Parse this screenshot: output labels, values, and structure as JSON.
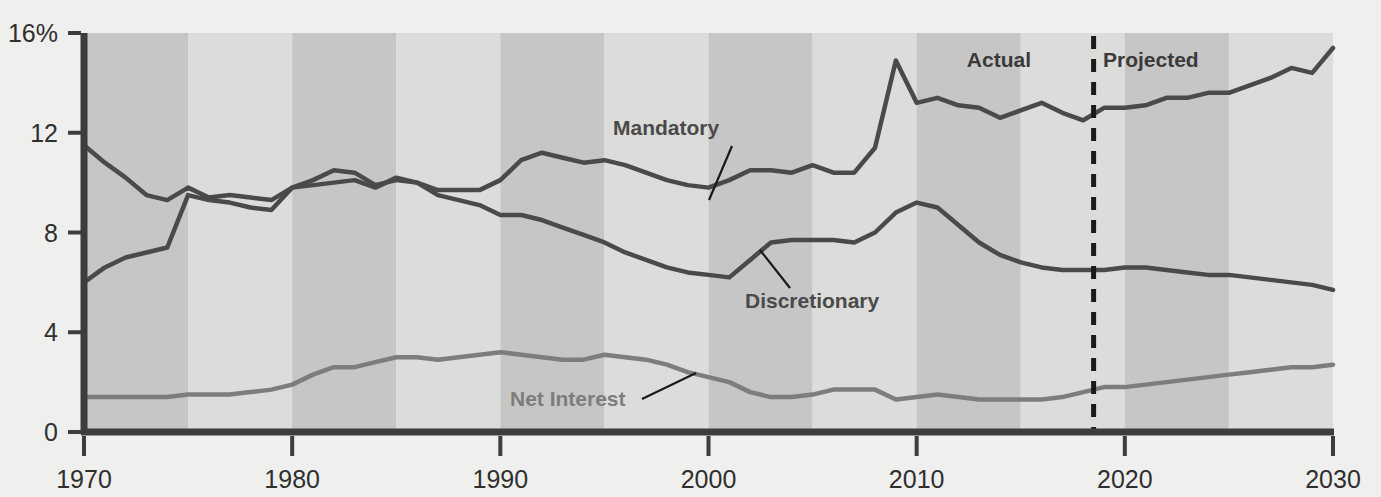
{
  "chart_data": {
    "type": "line",
    "title": "",
    "subtitle": "",
    "xlabel": "",
    "ylabel": "",
    "xlim": [
      1970,
      2030
    ],
    "ylim": [
      0,
      16
    ],
    "grid": false,
    "legend_position": "inline-annotations",
    "y_ticks": [
      0,
      4,
      8,
      12,
      16
    ],
    "y_tick_labels": [
      "0",
      "4",
      "8",
      "12",
      "16%"
    ],
    "x_ticks": [
      1970,
      1980,
      1990,
      2000,
      2010,
      2020,
      2030
    ],
    "x_tick_labels": [
      "1970",
      "1980",
      "1990",
      "2000",
      "2010",
      "2020",
      "2030"
    ],
    "x": [
      1970,
      1971,
      1972,
      1973,
      1974,
      1975,
      1976,
      1977,
      1978,
      1979,
      1980,
      1981,
      1982,
      1983,
      1984,
      1985,
      1986,
      1987,
      1988,
      1989,
      1990,
      1991,
      1992,
      1993,
      1994,
      1995,
      1996,
      1997,
      1998,
      1999,
      2000,
      2001,
      2002,
      2003,
      2004,
      2005,
      2006,
      2007,
      2008,
      2009,
      2010,
      2011,
      2012,
      2013,
      2014,
      2015,
      2016,
      2017,
      2018,
      2019,
      2020,
      2021,
      2022,
      2023,
      2024,
      2025,
      2026,
      2027,
      2028,
      2029,
      2030
    ],
    "series": [
      {
        "name": "Mandatory",
        "color": "#4a4a4a",
        "values": [
          6.0,
          6.6,
          7.0,
          7.2,
          7.4,
          9.5,
          9.3,
          9.2,
          9.0,
          8.9,
          9.8,
          10.1,
          10.5,
          10.4,
          9.9,
          10.1,
          10.0,
          9.7,
          9.7,
          9.7,
          10.1,
          10.9,
          11.2,
          11.0,
          10.8,
          10.9,
          10.7,
          10.4,
          10.1,
          9.9,
          9.8,
          10.1,
          10.5,
          10.5,
          10.4,
          10.7,
          10.4,
          10.4,
          11.4,
          14.9,
          13.2,
          13.4,
          13.1,
          13.0,
          12.6,
          12.9,
          13.2,
          12.8,
          12.5,
          13.0,
          13.0,
          13.1,
          13.4,
          13.4,
          13.6,
          13.6,
          13.9,
          14.2,
          14.6,
          14.4,
          15.4
        ]
      },
      {
        "name": "Discretionary",
        "color": "#4a4a4a",
        "values": [
          11.5,
          10.8,
          10.2,
          9.5,
          9.3,
          9.8,
          9.4,
          9.5,
          9.4,
          9.3,
          9.8,
          9.9,
          10.0,
          10.1,
          9.8,
          10.2,
          10.0,
          9.5,
          9.3,
          9.1,
          8.7,
          8.7,
          8.5,
          8.2,
          7.9,
          7.6,
          7.2,
          6.9,
          6.6,
          6.4,
          6.3,
          6.2,
          6.9,
          7.6,
          7.7,
          7.7,
          7.7,
          7.6,
          8.0,
          8.8,
          9.2,
          9.0,
          8.3,
          7.6,
          7.1,
          6.8,
          6.6,
          6.5,
          6.5,
          6.5,
          6.6,
          6.6,
          6.5,
          6.4,
          6.3,
          6.3,
          6.2,
          6.1,
          6.0,
          5.9,
          5.7
        ]
      },
      {
        "name": "Net Interest",
        "color": "#7d7d7d",
        "values": [
          1.4,
          1.4,
          1.4,
          1.4,
          1.4,
          1.5,
          1.5,
          1.5,
          1.6,
          1.7,
          1.9,
          2.3,
          2.6,
          2.6,
          2.8,
          3.0,
          3.0,
          2.9,
          3.0,
          3.1,
          3.2,
          3.1,
          3.0,
          2.9,
          2.9,
          3.1,
          3.0,
          2.9,
          2.7,
          2.4,
          2.2,
          2.0,
          1.6,
          1.4,
          1.4,
          1.5,
          1.7,
          1.7,
          1.7,
          1.3,
          1.4,
          1.5,
          1.4,
          1.3,
          1.3,
          1.3,
          1.3,
          1.4,
          1.6,
          1.8,
          1.8,
          1.9,
          2.0,
          2.1,
          2.2,
          2.3,
          2.4,
          2.5,
          2.6,
          2.6,
          2.7
        ]
      }
    ],
    "annotations": [
      {
        "name": "mandatory-label",
        "text": "Mandatory",
        "label_x": 613,
        "label_y": 135,
        "leader_from_x": 732,
        "leader_from_y": 146,
        "leader_to_x": 709,
        "leader_to_y": 200
      },
      {
        "name": "discretionary-label",
        "text": "Discretionary",
        "label_x": 745,
        "label_y": 308,
        "leader_from_x": 790,
        "leader_from_y": 288,
        "leader_to_x": 760,
        "leader_to_y": 250
      },
      {
        "name": "net-interest-label",
        "text": "Net Interest",
        "label_x": 510,
        "label_y": 406,
        "leader_from_x": 642,
        "leader_from_y": 399,
        "leader_to_x": 696,
        "leader_to_y": 373
      },
      {
        "name": "actual-label",
        "text": "Actual",
        "label_x": 1031,
        "label_y": 67
      },
      {
        "name": "projected-label",
        "text": "Projected",
        "label_x": 1103,
        "label_y": 67
      }
    ],
    "divider": {
      "name": "actual-projected-divider",
      "x_value": 2018.5,
      "style": "dashed",
      "color": "#1a1a1a"
    },
    "band_interval_years": 5,
    "band_colors": [
      "#c6c6c6",
      "#dcdcda"
    ],
    "background_color": "#efefed",
    "axis_color": "#3d3d3d"
  }
}
